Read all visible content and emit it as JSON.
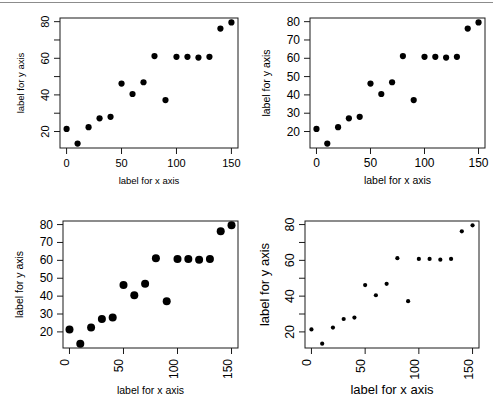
{
  "figure": {
    "background": "#ffffff",
    "rule_color": "#8c8c8c",
    "point_color": "#000000",
    "axis_color": "#1a1a1a",
    "layout": "2x2"
  },
  "chart_data": {
    "type": "scatter",
    "title": "",
    "xlabel": "label for x axis",
    "ylabel": "label for y axis",
    "xlim": [
      -6,
      156
    ],
    "ylim": [
      11,
      82
    ],
    "grid": false,
    "legend": null,
    "x": [
      0,
      10,
      20,
      30,
      40,
      50,
      60,
      70,
      80,
      90,
      100,
      110,
      120,
      130,
      140,
      150
    ],
    "y": [
      21.4,
      13.4,
      22.4,
      27.2,
      28.0,
      46.2,
      40.5,
      46.9,
      61.2,
      37.2,
      60.8,
      60.8,
      60.4,
      60.8,
      76.2,
      79.6
    ],
    "points": [
      {
        "x": 0,
        "y": 21.4
      },
      {
        "x": 10,
        "y": 13.4
      },
      {
        "x": 20,
        "y": 22.4
      },
      {
        "x": 30,
        "y": 27.2
      },
      {
        "x": 40,
        "y": 28.0
      },
      {
        "x": 50,
        "y": 46.2
      },
      {
        "x": 60,
        "y": 40.5
      },
      {
        "x": 70,
        "y": 46.9
      },
      {
        "x": 80,
        "y": 61.2
      },
      {
        "x": 90,
        "y": 37.2
      },
      {
        "x": 100,
        "y": 60.8
      },
      {
        "x": 110,
        "y": 60.8
      },
      {
        "x": 120,
        "y": 60.4
      },
      {
        "x": 130,
        "y": 60.8
      },
      {
        "x": 140,
        "y": 76.2
      },
      {
        "x": 150,
        "y": 79.6
      }
    ],
    "panels": [
      {
        "id": "top-left",
        "xlabel": "label for x axis",
        "ylabel": "label for y axis",
        "x_ticks": [
          0,
          50,
          100,
          150
        ],
        "x_tick_labels": [
          "0",
          "50",
          "100",
          "150"
        ],
        "y_ticks": [
          20,
          40,
          60,
          80
        ],
        "y_tick_labels": [
          "20",
          "40",
          "60",
          "80"
        ],
        "y_minor_ticks": [
          30,
          50,
          70
        ],
        "x_label_rotation": 0,
        "y_label_rotation": 90,
        "point_size": 3.1,
        "tick_font_size": 11,
        "title_font_size": 9.5
      },
      {
        "id": "top-right",
        "xlabel": "label for x axis",
        "ylabel": "label for y axis",
        "x_ticks": [
          0,
          50,
          100,
          150
        ],
        "x_tick_labels": [
          "0",
          "50",
          "100",
          "150"
        ],
        "y_ticks": [
          20,
          30,
          40,
          50,
          60,
          70,
          80
        ],
        "y_tick_labels": [
          "20",
          "30",
          "40",
          "50",
          "60",
          "70",
          "80"
        ],
        "y_minor_ticks": [],
        "x_label_rotation": 0,
        "y_label_rotation": 0,
        "point_size": 3.1,
        "tick_font_size": 12,
        "title_font_size": 10.5
      },
      {
        "id": "bottom-left",
        "xlabel": "label for x axis",
        "ylabel": "label for y axis",
        "x_ticks": [
          0,
          50,
          100,
          150
        ],
        "x_tick_labels": [
          "0",
          "50",
          "100",
          "150"
        ],
        "y_ticks": [
          20,
          30,
          40,
          50,
          60,
          70,
          80
        ],
        "y_tick_labels": [
          "20",
          "30",
          "40",
          "50",
          "60",
          "70",
          "80"
        ],
        "y_minor_ticks": [],
        "x_label_rotation": 90,
        "y_label_rotation": 0,
        "point_size": 4.0,
        "tick_font_size": 12,
        "title_font_size": 10.5
      },
      {
        "id": "bottom-right",
        "xlabel": "label for x axis",
        "ylabel": "label for y axis",
        "x_ticks": [
          0,
          50,
          100,
          150
        ],
        "x_tick_labels": [
          "0",
          "50",
          "100",
          "150"
        ],
        "y_ticks": [
          20,
          40,
          60,
          80
        ],
        "y_tick_labels": [
          "20",
          "40",
          "60",
          "80"
        ],
        "y_minor_ticks": [
          30,
          50,
          70
        ],
        "x_label_rotation": 90,
        "y_label_rotation": 90,
        "point_size": 2.1,
        "tick_font_size": 12.5,
        "title_font_size": 13
      }
    ]
  }
}
